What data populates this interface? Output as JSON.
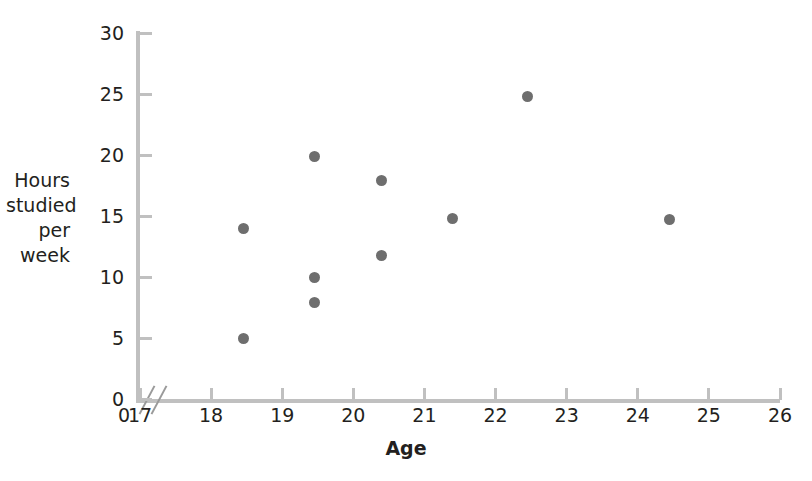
{
  "chart_data": {
    "type": "scatter",
    "title": "",
    "xlabel": "Age",
    "ylabel": "Hours studied per week",
    "ylabel_lines": [
      "Hours",
      "studied",
      "per",
      "week"
    ],
    "xlim": [
      17,
      26
    ],
    "ylim": [
      0,
      30
    ],
    "x_ticks": [
      17,
      18,
      19,
      20,
      21,
      22,
      23,
      24,
      25,
      26
    ],
    "y_ticks": [
      0,
      5,
      10,
      15,
      20,
      25,
      30
    ],
    "x_tick_labels": [
      "17",
      "18",
      "19",
      "20",
      "21",
      "22",
      "23",
      "24",
      "25",
      "26"
    ],
    "y_tick_labels": [
      "0",
      "5",
      "10",
      "15",
      "20",
      "25",
      "30"
    ],
    "origin_label_y": "0",
    "origin_label_x": "0",
    "axis_break": true,
    "grid": false,
    "legend": false,
    "marker_color": "#6e6e6e",
    "axis_color": "#c0c0c0",
    "points": [
      {
        "x": 18.45,
        "y": 14.0
      },
      {
        "x": 18.45,
        "y": 5.0
      },
      {
        "x": 19.45,
        "y": 19.9
      },
      {
        "x": 19.45,
        "y": 10.0
      },
      {
        "x": 19.45,
        "y": 7.9
      },
      {
        "x": 20.4,
        "y": 17.9
      },
      {
        "x": 20.4,
        "y": 11.8
      },
      {
        "x": 21.4,
        "y": 14.8
      },
      {
        "x": 22.45,
        "y": 24.8
      },
      {
        "x": 24.45,
        "y": 14.7
      }
    ]
  }
}
